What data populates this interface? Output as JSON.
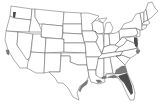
{
  "map": {
    "title": "",
    "region": "Contiguous United States",
    "description": "County-level distribution map with state outlines; shaded counties indicate presence",
    "colors": {
      "background": "#ffffff",
      "state_fill": "#ffffff",
      "state_border": "#4a4a4a",
      "shaded_fill": "#7a7a7a",
      "dense_fill": "#4d4d4d"
    },
    "shaded_regions": [
      {
        "name": "Florida peninsula",
        "density": "high"
      },
      {
        "name": "Southern Georgia",
        "density": "medium"
      },
      {
        "name": "Florida panhandle coast",
        "density": "medium"
      },
      {
        "name": "Alabama/Mississippi Gulf coast",
        "density": "low"
      },
      {
        "name": "Louisiana coast",
        "density": "low"
      },
      {
        "name": "Texas Gulf coast",
        "density": "low"
      },
      {
        "name": "Chesapeake Bay (Maryland/Virginia/Delaware)",
        "density": "high"
      },
      {
        "name": "North Carolina coast",
        "density": "low"
      },
      {
        "name": "Puget Sound, Washington",
        "density": "low"
      },
      {
        "name": "Coastal California",
        "density": "low"
      }
    ]
  }
}
